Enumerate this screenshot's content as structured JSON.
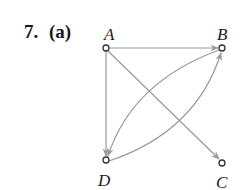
{
  "problem": {
    "number": "7.",
    "part": "(a)"
  },
  "graph": {
    "directed": true,
    "edge_color": "#999999",
    "node_stroke": "#333333",
    "nodes": [
      {
        "id": "A",
        "label": "A",
        "x": 106,
        "y": 48
      },
      {
        "id": "B",
        "label": "B",
        "x": 222,
        "y": 48
      },
      {
        "id": "C",
        "label": "C",
        "x": 222,
        "y": 163
      },
      {
        "id": "D",
        "label": "D",
        "x": 106,
        "y": 160
      }
    ],
    "edges": [
      {
        "from": "A",
        "to": "B",
        "shape": "straight"
      },
      {
        "from": "A",
        "to": "D",
        "shape": "straight"
      },
      {
        "from": "A",
        "to": "C",
        "shape": "straight"
      },
      {
        "from": "B",
        "to": "D",
        "shape": "curved"
      },
      {
        "from": "D",
        "to": "B",
        "shape": "curved"
      }
    ]
  }
}
